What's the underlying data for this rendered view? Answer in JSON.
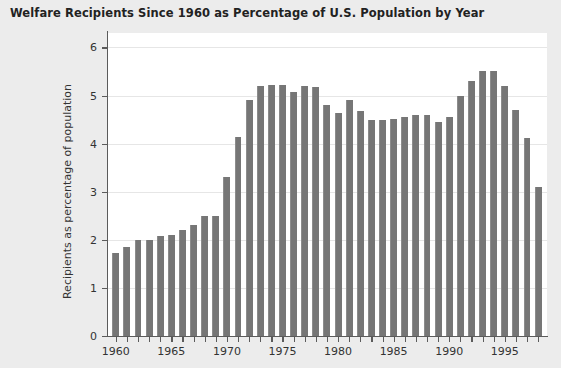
{
  "chart_data": {
    "type": "bar",
    "title": "Welfare Recipients Since 1960 as Percentage of U.S. Population by Year",
    "xlabel": "",
    "ylabel": "Recipients as percentage of population",
    "ylim": [
      0,
      6.3
    ],
    "xlim": [
      1959.3,
      1998.8
    ],
    "grid": true,
    "legend": null,
    "y_ticks": [
      0,
      1,
      2,
      3,
      4,
      5,
      6
    ],
    "y_tick_labels": [
      "0",
      "1",
      "2",
      "3",
      "4",
      "5",
      "6"
    ],
    "x_ticks": [
      1960,
      1961,
      1962,
      1963,
      1964,
      1965,
      1966,
      1967,
      1968,
      1969,
      1970,
      1971,
      1972,
      1973,
      1974,
      1975,
      1976,
      1977,
      1978,
      1979,
      1980,
      1981,
      1982,
      1983,
      1984,
      1985,
      1986,
      1987,
      1988,
      1989,
      1990,
      1991,
      1992,
      1993,
      1994,
      1995,
      1996,
      1997,
      1998
    ],
    "x_tick_labels": [
      "1960",
      "1965",
      "1970",
      "1975",
      "1980",
      "1985",
      "1990",
      "1995"
    ],
    "labeled_x_ticks": [
      1960,
      1965,
      1970,
      1975,
      1980,
      1985,
      1990,
      1995
    ],
    "categories": [
      1960,
      1961,
      1962,
      1963,
      1964,
      1965,
      1966,
      1967,
      1968,
      1969,
      1970,
      1971,
      1972,
      1973,
      1974,
      1975,
      1976,
      1977,
      1978,
      1979,
      1980,
      1981,
      1982,
      1983,
      1984,
      1985,
      1986,
      1987,
      1988,
      1989,
      1990,
      1991,
      1992,
      1993,
      1994,
      1995,
      1996,
      1997,
      1998
    ],
    "values": [
      1.73,
      1.85,
      2.0,
      2.0,
      2.07,
      2.11,
      2.2,
      2.3,
      2.5,
      2.5,
      3.3,
      4.13,
      4.9,
      5.2,
      5.22,
      5.22,
      5.07,
      5.2,
      5.17,
      4.8,
      4.63,
      4.9,
      4.68,
      4.5,
      4.5,
      4.52,
      4.55,
      4.6,
      4.6,
      4.45,
      4.55,
      5.0,
      5.3,
      5.5,
      5.5,
      5.2,
      4.7,
      4.12,
      3.1
    ],
    "bar_color": "#767676",
    "plot_bg": "#ffffff",
    "figure_bg": "#ececec",
    "grid_color": "#e6e6e6",
    "axis_color": "#5b5b5b",
    "text_color": "#333333",
    "title_color": "#222222"
  }
}
